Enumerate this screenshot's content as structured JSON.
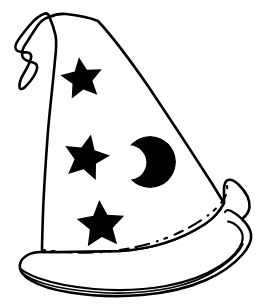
{
  "document": {
    "title": "Wizard Hat",
    "subject": "wizard-hat-line-art",
    "style": "black-and-white coloring-book line drawing",
    "width": 267,
    "height": 305
  },
  "palette": {
    "ink": "#000000",
    "paper": "#ffffff"
  },
  "artwork": {
    "name": "wizard-hat",
    "background_color": "#ffffff",
    "line_color": "#000000",
    "stroke_width": 2.4,
    "parts": [
      {
        "name": "hat-cone",
        "description": "tall triangular cone body of the hat, white interior with black outline",
        "fill": "#ffffff",
        "stroke": "#000000"
      },
      {
        "name": "hat-droop-tip",
        "description": "floppy curled tip at the top of the cone bending down to the left",
        "fill": "#ffffff",
        "stroke": "#000000"
      },
      {
        "name": "hat-brim",
        "description": "wide curved brim sweeping out to the right with a double outline edge",
        "fill": "#ffffff",
        "stroke": "#000000"
      },
      {
        "name": "brim-hidden-edge",
        "description": "dashed line marking the far edge of the brim passing behind the cone",
        "stroke": "#000000",
        "dash": true
      }
    ],
    "decorations": [
      {
        "name": "star-top",
        "shape": "five-pointed-star",
        "fill": "#000000",
        "cx": 82,
        "cy": 79,
        "radius": 22,
        "rotation_deg": -8
      },
      {
        "name": "star-middle",
        "shape": "five-pointed-star",
        "fill": "#000000",
        "cx": 86,
        "cy": 158,
        "radius": 24,
        "rotation_deg": 12
      },
      {
        "name": "star-bottom",
        "shape": "five-pointed-star",
        "fill": "#000000",
        "cx": 101,
        "cy": 225,
        "radius": 25,
        "rotation_deg": -4
      },
      {
        "name": "crescent-moon",
        "shape": "crescent",
        "fill": "#000000",
        "cx": 150,
        "cy": 162,
        "radius": 26,
        "opening_direction": "left"
      }
    ]
  },
  "paths": {
    "cone_outline": "M 49.5 17 C 52 23 54 29 55.5 35 C 57 43 56 52 55 60 C 53 83 50 107 48 131 C 46 158 44 186 43 213 C 42.5 229 42 242 42 252 L 60 252 L 120 251 C 152 249 182 239 205 224 C 214 218 220 211 224 203 C 218 193 210 180 200 165 C 184 140 166 113 148 86 C 130 60 112 36 98 21 C 88 17 76 15 66 14 C 60 13.6 54 14.8 49.5 17 Z",
    "droop_tip": "M 49.5 17 C 45 18 41 21 38 25 C 34 31 30 37 27 42 C 24 46 22 50 22 54 C 22 58 25 60 28 61 C 31 62 34 62 36 64 C 38 66 37 70 35 74 C 32.5 79 28 84 25 87 C 22.5 89.5 20 90 19.5 87 C 19 83 21 78 24 73 C 27 68 30 63 31 58 C 31.6 55 30 53 27.5 52.5 C 24 51.8 20 52.5 17.5 51 C 15 49.5 15 46 16.5 43 C 19 38 24 32 29 26 C 34 20 40 15 45 13.5 C 47 13 48.8 14.5 49.5 17 Z",
    "brim_outer": "M 42 252 C 36 252 30 253 26 256 C 21 259.5 19 264 20 268.5 C 21 273 25 277 31 280.5 C 40 286 54 290 70 292.5 C 92 296 118 297 142 295 C 166 293 188 288 206 280 C 222 273 234 264 242 255 C 249 247 252 240 251 234 C 250 228 246 223 242 219 C 246 216 249 212 249.5 207 C 250 200 246 192 239 185 C 235 181 231 179 228 180 C 225 181 224 185 224 190 C 224 196 224 200 224 203 C 220 211 214 218 205 224 C 182 239 152 249 120 251 L 60 252 Z",
    "brim_inner_line": "M 20 268.5 C 24 272 30 275 38 278 C 52 283 72 287 94 289 C 118 291 144 290 166 286 C 188 282 206 275 220 266 C 232 258 240 249 242 242 C 243.5 237 242.5 232 239 228 C 236 224.5 232 222 228 221.5",
    "brim_inner_line_2": "M 22 273 C 27 277 34 280.5 44 283.5 C 58 288 78 291 100 292.5 C 124 294 148 292.5 170 288 C 190 284 208 276 221 267 C 232 259.5 240 251 243 244",
    "brim_right_edge": "M 242 219 C 238 215 234 212.5 231 211 C 228 209.5 226 210 225 212",
    "brim_hidden_dashed": "M 44 250 C 60 252.5 80 253.5 102 252 C 128 250 154 244 176 234 C 196 225 212 214 221 203 C 226 197 228 191 227 186"
  }
}
